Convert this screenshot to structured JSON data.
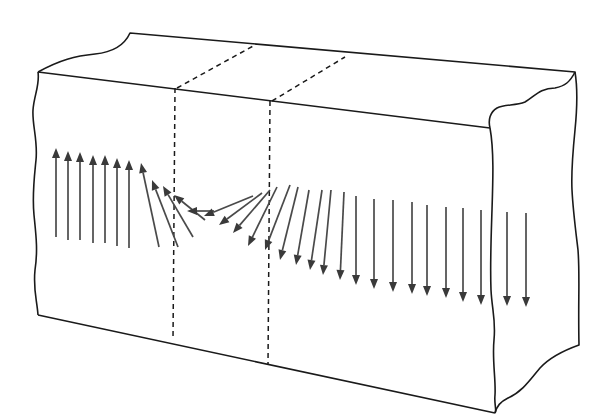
{
  "diagram": {
    "colors": {
      "outline": "#1a1a1a",
      "arrow": "#3a3a3a",
      "background": "#ffffff"
    },
    "block": {
      "front_face": [
        [
          38,
          72
        ],
        [
          490,
          128
        ],
        [
          495,
          413
        ],
        [
          38,
          315
        ]
      ],
      "top_back_edge": [
        [
          130,
          33
        ],
        [
          575,
          72
        ]
      ],
      "wall_planes": [
        {
          "top": [
            [
              177,
              88
            ],
            [
              255,
              45
            ]
          ],
          "front_x": 175,
          "front_y": [
            88,
            340
          ]
        },
        {
          "top": [
            [
              272,
              101
            ],
            [
              345,
              57
            ]
          ],
          "front_x": 270,
          "front_y": [
            101,
            365
          ]
        }
      ]
    },
    "arrows": [
      {
        "x1": 56,
        "y1": 237,
        "x2": 56,
        "y2": 148
      },
      {
        "x1": 68,
        "y1": 240,
        "x2": 68,
        "y2": 151
      },
      {
        "x1": 80,
        "y1": 240,
        "x2": 80,
        "y2": 152
      },
      {
        "x1": 93,
        "y1": 243,
        "x2": 93,
        "y2": 155
      },
      {
        "x1": 105,
        "y1": 243,
        "x2": 105,
        "y2": 155
      },
      {
        "x1": 117,
        "y1": 246,
        "x2": 117,
        "y2": 158
      },
      {
        "x1": 129,
        "y1": 248,
        "x2": 129,
        "y2": 160
      },
      {
        "x1": 159,
        "y1": 247,
        "x2": 141,
        "y2": 163
      },
      {
        "x1": 178,
        "y1": 247,
        "x2": 152,
        "y2": 180
      },
      {
        "x1": 193,
        "y1": 237,
        "x2": 163,
        "y2": 186
      },
      {
        "x1": 205,
        "y1": 220,
        "x2": 174,
        "y2": 195
      },
      {
        "x1": 214,
        "y1": 211,
        "x2": 187,
        "y2": 211
      },
      {
        "x1": 253,
        "y1": 196,
        "x2": 204,
        "y2": 216
      },
      {
        "x1": 262,
        "y1": 193,
        "x2": 219,
        "y2": 225
      },
      {
        "x1": 270,
        "y1": 190,
        "x2": 233,
        "y2": 233
      },
      {
        "x1": 277,
        "y1": 187,
        "x2": 248,
        "y2": 246
      },
      {
        "x1": 290,
        "y1": 185,
        "x2": 265,
        "y2": 250
      },
      {
        "x1": 298,
        "y1": 187,
        "x2": 280,
        "y2": 260
      },
      {
        "x1": 309,
        "y1": 190,
        "x2": 296,
        "y2": 265
      },
      {
        "x1": 322,
        "y1": 190,
        "x2": 310,
        "y2": 270
      },
      {
        "x1": 331,
        "y1": 190,
        "x2": 323,
        "y2": 275
      },
      {
        "x1": 344,
        "y1": 192,
        "x2": 340,
        "y2": 280
      },
      {
        "x1": 356,
        "y1": 196,
        "x2": 356,
        "y2": 285
      },
      {
        "x1": 374,
        "y1": 199,
        "x2": 374,
        "y2": 289
      },
      {
        "x1": 393,
        "y1": 200,
        "x2": 393,
        "y2": 292
      },
      {
        "x1": 412,
        "y1": 202,
        "x2": 412,
        "y2": 294
      },
      {
        "x1": 427,
        "y1": 205,
        "x2": 427,
        "y2": 296
      },
      {
        "x1": 446,
        "y1": 207,
        "x2": 446,
        "y2": 298
      },
      {
        "x1": 463,
        "y1": 208,
        "x2": 463,
        "y2": 302
      },
      {
        "x1": 481,
        "y1": 210,
        "x2": 481,
        "y2": 305
      },
      {
        "x1": 507,
        "y1": 212,
        "x2": 507,
        "y2": 306
      },
      {
        "x1": 526,
        "y1": 213,
        "x2": 526,
        "y2": 307
      }
    ]
  }
}
